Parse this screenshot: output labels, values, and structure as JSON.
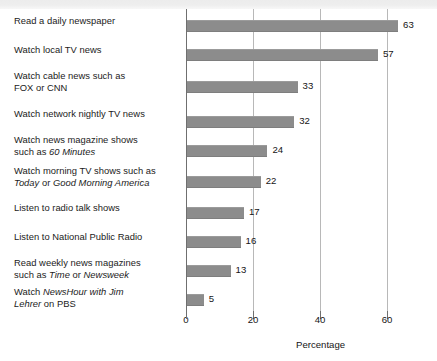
{
  "chart_data": {
    "type": "bar",
    "orientation": "horizontal",
    "title": "",
    "xlabel": "Percentage",
    "ylabel": "",
    "xlim": [
      0,
      70
    ],
    "xticks": [
      0,
      20,
      40,
      60
    ],
    "grid": true,
    "legend": null,
    "bar_color": "#8c8c8c",
    "categories": [
      "Read a daily newspaper",
      "Watch local TV news",
      "Watch cable news such as FOX or CNN",
      "Watch network nightly TV news",
      "Watch news magazine shows such as 60 Minutes",
      "Watch morning TV shows such as Today or Good Morning America",
      "Listen to radio talk shows",
      "Listen to National Public Radio",
      "Read weekly news magazines such as Time or Newsweek",
      "Watch NewsHour with Jim Lehrer on PBS"
    ],
    "values": [
      63,
      57,
      33,
      32,
      24,
      22,
      17,
      16,
      13,
      5
    ],
    "value_labels": [
      "63",
      "57",
      "33",
      "32",
      "24",
      "22",
      "17",
      "16",
      "13",
      "5"
    ]
  },
  "labels": [
    {
      "lines": [
        [
          {
            "t": "Read a daily newspaper",
            "i": false
          }
        ]
      ]
    },
    {
      "lines": [
        [
          {
            "t": "Watch local TV news",
            "i": false
          }
        ]
      ]
    },
    {
      "lines": [
        [
          {
            "t": "Watch cable news such as",
            "i": false
          }
        ],
        [
          {
            "t": "FOX or CNN",
            "i": false
          }
        ]
      ]
    },
    {
      "lines": [
        [
          {
            "t": "Watch network nightly TV news",
            "i": false
          }
        ]
      ]
    },
    {
      "lines": [
        [
          {
            "t": "Watch news magazine shows",
            "i": false
          }
        ],
        [
          {
            "t": "such as ",
            "i": false
          },
          {
            "t": "60 Minutes",
            "i": true
          }
        ]
      ]
    },
    {
      "lines": [
        [
          {
            "t": "Watch morning TV shows such as",
            "i": false
          }
        ],
        [
          {
            "t": "Today",
            "i": true
          },
          {
            "t": " or ",
            "i": false
          },
          {
            "t": "Good Morning America",
            "i": true
          }
        ]
      ]
    },
    {
      "lines": [
        [
          {
            "t": "Listen to radio talk shows",
            "i": false
          }
        ]
      ]
    },
    {
      "lines": [
        [
          {
            "t": "Listen to National Public Radio",
            "i": false
          }
        ]
      ]
    },
    {
      "lines": [
        [
          {
            "t": "Read weekly news magazines",
            "i": false
          }
        ],
        [
          {
            "t": "such as ",
            "i": false
          },
          {
            "t": "Time",
            "i": true
          },
          {
            "t": " or ",
            "i": false
          },
          {
            "t": "Newsweek",
            "i": true
          }
        ]
      ]
    },
    {
      "lines": [
        [
          {
            "t": "Watch ",
            "i": false
          },
          {
            "t": "NewsHour with Jim",
            "i": true
          }
        ],
        [
          {
            "t": "Lehrer",
            "i": true
          },
          {
            "t": " on PBS",
            "i": false
          }
        ]
      ]
    }
  ],
  "axis": {
    "tick_labels": [
      "0",
      "20",
      "40",
      "60"
    ],
    "x_title": "Percentage"
  }
}
